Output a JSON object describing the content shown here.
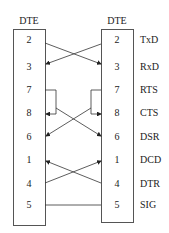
{
  "diagram": {
    "left": {
      "title": "DTE",
      "pins": [
        "2",
        "3",
        "7",
        "8",
        "6",
        "1",
        "4",
        "5"
      ]
    },
    "right": {
      "title": "DTE",
      "pins": [
        "2",
        "3",
        "7",
        "8",
        "6",
        "1",
        "4",
        "5"
      ],
      "signals": [
        "TxD",
        "RxD",
        "RTS",
        "CTS",
        "DSR",
        "DCD",
        "DTR",
        "SIG"
      ]
    },
    "line_color": "#333333"
  }
}
